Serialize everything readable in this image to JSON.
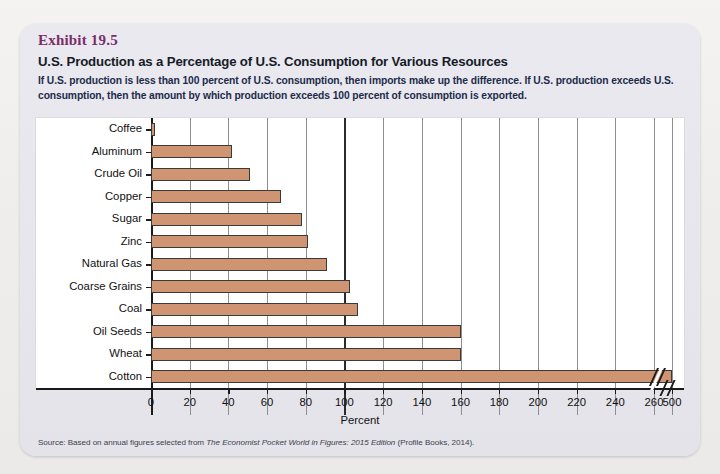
{
  "exhibit": {
    "number": "Exhibit 19.5",
    "title": "U.S. Production as a Percentage of U.S. Consumption for Various Resources",
    "subtitle": "If U.S. production is less than 100 percent of U.S. consumption, then imports make up the difference. If U.S. production exceeds U.S. consumption, then the amount by which production exceeds 100 percent of consumption is exported.",
    "source_prefix": "Source: Based on annual figures selected from ",
    "source_italic": "The Economist Pocket World in Figures: 2015 Edition",
    "source_suffix": " (Profile Books, 2014)."
  },
  "colors": {
    "bar_fill": "#cf9572",
    "bar_stroke": "#3a3a3a",
    "exhibit_number": "#7b2d6a",
    "title": "#171b28",
    "subtitle": "#1d2b4a",
    "card_bg": "#e6e6ec",
    "plot_bg": "#ffffff",
    "gridline": "#8e8e8e",
    "axis": "#1a1a1a"
  },
  "chart_data": {
    "type": "bar",
    "orientation": "horizontal",
    "title": "U.S. Production as a Percentage of U.S. Consumption for Various Resources",
    "xlabel": "Percent",
    "ylabel": "",
    "categories": [
      "Coffee",
      "Aluminum",
      "Crude Oil",
      "Copper",
      "Sugar",
      "Zinc",
      "Natural Gas",
      "Coarse Grains",
      "Coal",
      "Oil Seeds",
      "Wheat",
      "Cotton"
    ],
    "values": [
      2,
      42,
      51,
      67,
      78,
      81,
      91,
      103,
      107,
      160,
      160,
      500
    ],
    "xticks": [
      0,
      20,
      40,
      60,
      80,
      100,
      120,
      140,
      160,
      180,
      200,
      220,
      240,
      260,
      500
    ],
    "xtick_labels": [
      "0",
      "20",
      "40",
      "60",
      "80",
      "100",
      "120",
      "140",
      "160",
      "180",
      "200",
      "220",
      "240",
      "260",
      "500"
    ],
    "xlim": [
      0,
      280
    ],
    "axis_break": {
      "after": 260,
      "resumes_at": 500,
      "note": "axis break between 260 and 500"
    },
    "grid": "vertical",
    "major_gridline_at": 100,
    "legend": null
  }
}
